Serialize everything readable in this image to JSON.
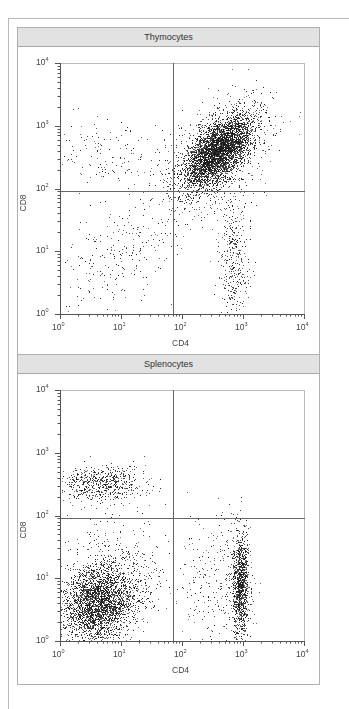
{
  "chart_data": [
    {
      "type": "scatter",
      "title": "Thymocytes",
      "xlabel": "CD4",
      "ylabel": "CD8",
      "xscale": "log",
      "yscale": "log",
      "xlim": [
        1,
        10000
      ],
      "ylim": [
        1,
        10000
      ],
      "x_ticks": [
        "10^0",
        "10^1",
        "10^2",
        "10^3",
        "10^4"
      ],
      "y_ticks": [
        "10^0",
        "10^1",
        "10^2",
        "10^3",
        "10^4"
      ],
      "quadrant_gate": {
        "x": 70,
        "y": 90
      },
      "grid": false,
      "populations": [
        {
          "name": "CD4+CD8+ double positive",
          "center": [
            400,
            400
          ],
          "spread_log": [
            0.28,
            0.3
          ],
          "corr": 0.6,
          "n": 3800
        },
        {
          "name": "CD4+CD8+ diffuse halo",
          "center": [
            300,
            300
          ],
          "spread_log": [
            0.45,
            0.45
          ],
          "corr": 0.5,
          "n": 900
        },
        {
          "name": "CD4+ single positive",
          "center": [
            700,
            8
          ],
          "spread_log": [
            0.12,
            0.55
          ],
          "corr": 0.0,
          "n": 380
        },
        {
          "name": "CD8+ single positive",
          "center": [
            6,
            350
          ],
          "spread_log": [
            0.45,
            0.3
          ],
          "corr": 0.0,
          "n": 140
        },
        {
          "name": "Double negative",
          "center": [
            8,
            8
          ],
          "spread_log": [
            0.45,
            0.45
          ],
          "corr": 0.4,
          "n": 240
        }
      ]
    },
    {
      "type": "scatter",
      "title": "Splenocytes",
      "xlabel": "CD4",
      "ylabel": "CD8",
      "xscale": "log",
      "yscale": "log",
      "xlim": [
        1,
        10000
      ],
      "ylim": [
        1,
        10000
      ],
      "x_ticks": [
        "10^0",
        "10^1",
        "10^2",
        "10^3",
        "10^4"
      ],
      "y_ticks": [
        "10^0",
        "10^1",
        "10^2",
        "10^3",
        "10^4"
      ],
      "quadrant_gate": {
        "x": 70,
        "y": 90
      },
      "grid": false,
      "populations": [
        {
          "name": "Double negative (B cells etc.)",
          "center": [
            4,
            4
          ],
          "spread_log": [
            0.3,
            0.3
          ],
          "corr": 0.2,
          "n": 2600
        },
        {
          "name": "Double negative halo",
          "center": [
            6,
            8
          ],
          "spread_log": [
            0.45,
            0.5
          ],
          "corr": 0.2,
          "n": 700
        },
        {
          "name": "CD8+ single positive",
          "center": [
            5,
            320
          ],
          "spread_log": [
            0.35,
            0.15
          ],
          "corr": 0.0,
          "n": 600
        },
        {
          "name": "CD4+ single positive",
          "center": [
            900,
            8
          ],
          "spread_log": [
            0.07,
            0.45
          ],
          "corr": 0.0,
          "n": 1100
        },
        {
          "name": "CD4+ diffuse",
          "center": [
            350,
            10
          ],
          "spread_log": [
            0.3,
            0.5
          ],
          "corr": 0.0,
          "n": 260
        }
      ]
    }
  ],
  "panels": [
    {
      "title": "Thymocytes",
      "xlabel": "CD4",
      "ylabel": "CD8"
    },
    {
      "title": "Splenocytes",
      "xlabel": "CD4",
      "ylabel": "CD8"
    }
  ],
  "ticks": {
    "exp": [
      "0",
      "1",
      "2",
      "3",
      "4"
    ],
    "base": "10"
  },
  "colors": {
    "dot": "#1a1a1a",
    "axis": "#555555",
    "gate": "#666666",
    "title_bg": "#e2e2e2"
  }
}
